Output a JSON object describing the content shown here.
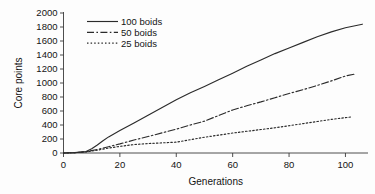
{
  "chart_data": {
    "type": "line",
    "title": "",
    "xlabel": "Generations",
    "ylabel": "Core points",
    "xlim": [
      0,
      108
    ],
    "ylim": [
      0,
      2000
    ],
    "xticks": [
      0,
      20,
      40,
      60,
      80,
      100
    ],
    "yticks": [
      0,
      200,
      400,
      600,
      800,
      1000,
      1200,
      1400,
      1600,
      1800,
      2000
    ],
    "xtick_labels": [
      "0",
      "20",
      "40",
      "60",
      "80",
      "100"
    ],
    "ytick_labels": [
      "0",
      "200",
      "400",
      "600",
      "800",
      "1000",
      "1200",
      "1400",
      "1600",
      "1800",
      "2000"
    ],
    "grid": false,
    "legend_position": "top-left",
    "line_color": "#2b2b2b",
    "axis_color": "#3a3a3a",
    "background_color": "#fdfdfd",
    "series": [
      {
        "name": "100 boids",
        "dash": "solid",
        "x": [
          0,
          4,
          8,
          10,
          12,
          14,
          16,
          20,
          25,
          30,
          35,
          40,
          45,
          50,
          55,
          60,
          65,
          70,
          75,
          80,
          85,
          90,
          95,
          100,
          103,
          106
        ],
        "values": [
          0,
          5,
          20,
          60,
          115,
          175,
          230,
          320,
          430,
          540,
          650,
          760,
          860,
          950,
          1045,
          1140,
          1240,
          1330,
          1420,
          1500,
          1580,
          1660,
          1730,
          1790,
          1815,
          1840
        ]
      },
      {
        "name": "50 boids",
        "dash": "dash-dot",
        "x": [
          0,
          4,
          8,
          12,
          16,
          20,
          25,
          30,
          35,
          40,
          45,
          50,
          55,
          60,
          65,
          70,
          75,
          80,
          85,
          90,
          95,
          100,
          103
        ],
        "values": [
          0,
          5,
          18,
          50,
          90,
          130,
          185,
          235,
          288,
          340,
          400,
          455,
          535,
          615,
          675,
          730,
          790,
          850,
          905,
          965,
          1030,
          1100,
          1125
        ]
      },
      {
        "name": "25 boids",
        "dash": "dotted",
        "x": [
          0,
          4,
          8,
          12,
          16,
          20,
          25,
          30,
          35,
          40,
          45,
          50,
          55,
          60,
          65,
          70,
          75,
          80,
          85,
          90,
          95,
          100,
          102
        ],
        "values": [
          0,
          4,
          15,
          40,
          70,
          95,
          120,
          135,
          145,
          155,
          190,
          225,
          255,
          285,
          310,
          335,
          360,
          390,
          420,
          450,
          480,
          505,
          515
        ]
      }
    ]
  },
  "figure": {
    "legend_entries": [
      "100 boids",
      "50 boids",
      "25 boids"
    ]
  }
}
